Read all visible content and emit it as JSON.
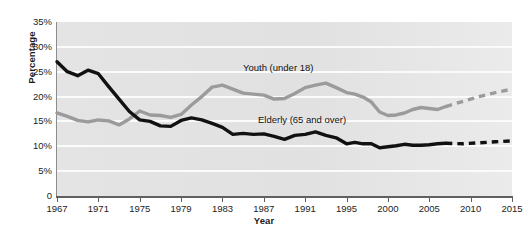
{
  "chart_data": {
    "type": "line",
    "title": "",
    "xlabel": "Year",
    "ylabel": "Percentage",
    "xlim": [
      1967,
      2015
    ],
    "ylim": [
      0,
      35
    ],
    "grid": true,
    "grid_axis": "y",
    "legend_position": "inline-annotation",
    "x_tick_labels": [
      "1967",
      "1971",
      "1975",
      "1979",
      "1983",
      "1987",
      "1991",
      "1995",
      "2000",
      "2005",
      "2010",
      "2015"
    ],
    "x_ticks": [
      1967,
      1971,
      1975,
      1979,
      1983,
      1987,
      1991,
      1995,
      2000,
      2005,
      2010,
      2015
    ],
    "y_tick_labels": [
      "35%",
      "30%",
      "25%",
      "20%",
      "15%",
      "10%",
      "5%",
      "0"
    ],
    "y_ticks": [
      35,
      30,
      25,
      20,
      15,
      10,
      5,
      0
    ],
    "series": [
      {
        "name": "Youth (under 18)",
        "color": "#9b9b9b",
        "style": "solid-then-dashed",
        "projection_starts": 2007,
        "x": [
          1967,
          1968,
          1969,
          1970,
          1971,
          1972,
          1973,
          1974,
          1975,
          1976,
          1977,
          1978,
          1979,
          1980,
          1981,
          1982,
          1983,
          1984,
          1985,
          1986,
          1987,
          1988,
          1989,
          1990,
          1991,
          1992,
          1993,
          1994,
          1995,
          1996,
          1997,
          1998,
          1999,
          2000,
          2001,
          2002,
          2003,
          2004,
          2005,
          2006,
          2007,
          2009,
          2011,
          2013,
          2015
        ],
        "y": [
          16.7,
          16.0,
          15.2,
          14.9,
          15.3,
          15.1,
          14.3,
          15.5,
          17.1,
          16.3,
          16.2,
          15.8,
          16.4,
          18.3,
          20.0,
          21.9,
          22.3,
          21.5,
          20.7,
          20.5,
          20.3,
          19.5,
          19.6,
          20.6,
          21.8,
          22.3,
          22.7,
          21.8,
          20.8,
          20.5,
          19.9,
          18.9,
          16.9,
          16.2,
          16.3,
          16.7,
          17.4,
          17.8,
          17.6,
          17.4,
          18.0,
          19.0,
          20.0,
          20.8,
          21.5
        ]
      },
      {
        "name": "Elderly (65 and over)",
        "color": "#111111",
        "style": "solid-then-dashed",
        "projection_starts": 2007,
        "x": [
          1967,
          1968,
          1969,
          1970,
          1971,
          1972,
          1973,
          1974,
          1975,
          1976,
          1977,
          1978,
          1979,
          1980,
          1981,
          1982,
          1983,
          1984,
          1985,
          1986,
          1987,
          1988,
          1989,
          1990,
          1991,
          1992,
          1993,
          1994,
          1995,
          1996,
          1997,
          1998,
          1999,
          2000,
          2001,
          2002,
          2003,
          2004,
          2005,
          2006,
          2007,
          2009,
          2011,
          2013,
          2015
        ],
        "y": [
          27.0,
          25.0,
          24.2,
          25.3,
          24.6,
          22.0,
          19.5,
          17.0,
          15.3,
          15.0,
          14.1,
          14.0,
          15.2,
          15.7,
          15.3,
          14.6,
          13.8,
          12.4,
          12.6,
          12.4,
          12.5,
          12.0,
          11.4,
          12.2,
          12.4,
          12.9,
          12.2,
          11.7,
          10.5,
          10.8,
          10.5,
          10.5,
          9.7,
          9.9,
          10.1,
          10.4,
          10.2,
          10.2,
          10.3,
          10.5,
          10.6,
          10.5,
          10.7,
          10.9,
          11.1
        ]
      }
    ]
  }
}
